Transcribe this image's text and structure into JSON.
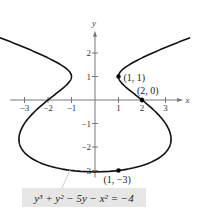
{
  "chart_data": {
    "type": "line",
    "title": "",
    "equation": "y^3 + y^2 - 5y - x^2 = -4",
    "equation_label": "y³ + y² − 5y − x² = −4",
    "xlabel": "x",
    "ylabel": "y",
    "xlim": [
      -3.5,
      3.7
    ],
    "ylim": [
      -3.3,
      3.0
    ],
    "x_ticks": [
      -3,
      -2,
      -1,
      1,
      2,
      3
    ],
    "y_ticks": [
      -3,
      -2,
      -1,
      1,
      2
    ],
    "grid": false,
    "points": [
      {
        "label": "(1, 1)",
        "x": 1,
        "y": 1
      },
      {
        "label": "(2, 0)",
        "x": 2,
        "y": 0
      },
      {
        "label": "(1, −3)",
        "x": 1,
        "y": -3
      }
    ],
    "series": [
      {
        "name": "implicit curve",
        "description": "x^2 = y^3 + y^2 - 5y + 4, plotted for y in [-3.08, 2.65]"
      }
    ]
  },
  "layout": {
    "origin_px": [
      95,
      100
    ],
    "unit_px": 23.5,
    "curve_color": "#111111",
    "axis_color": "#777777"
  }
}
